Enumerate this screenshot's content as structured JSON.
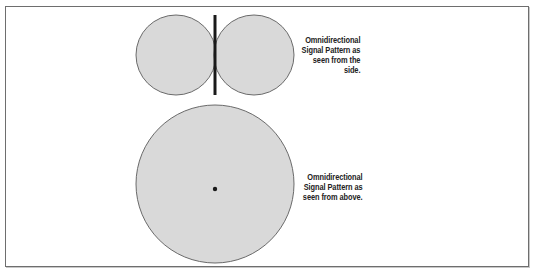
{
  "diagram": {
    "colors": {
      "pattern_fill": "#d9d9d9",
      "pattern_stroke": "#6a6a6a",
      "antenna": "#1a1a1a",
      "frame_border": "#6e6e6e",
      "background": "#ffffff"
    },
    "side_view": {
      "caption": "Omnidirectional\nSignal Pattern as\nseen from the\nside.",
      "lobes": [
        {
          "cx": 176,
          "cy": 55,
          "r": 40
        },
        {
          "cx": 254,
          "cy": 55,
          "r": 40
        }
      ],
      "antenna": {
        "x": 215,
        "y1": 15,
        "y2": 95,
        "width": 3
      }
    },
    "top_view": {
      "caption": "Omnidirectional\nSignal Pattern as\nseen from above.",
      "circle": {
        "cx": 215,
        "cy": 184,
        "r": 79
      },
      "antenna_dot": {
        "cx": 215,
        "cy": 189,
        "r": 2.2
      }
    }
  }
}
